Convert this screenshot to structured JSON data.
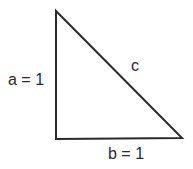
{
  "diagram": {
    "labels": {
      "side_a": "a = 1",
      "side_b": "b = 1",
      "hypotenuse": "c"
    },
    "vertices": {
      "top": [
        56,
        11
      ],
      "right_angle": [
        56,
        139
      ],
      "bottom_right": [
        182,
        138
      ]
    },
    "stroke_color": "#2a2a2a"
  }
}
